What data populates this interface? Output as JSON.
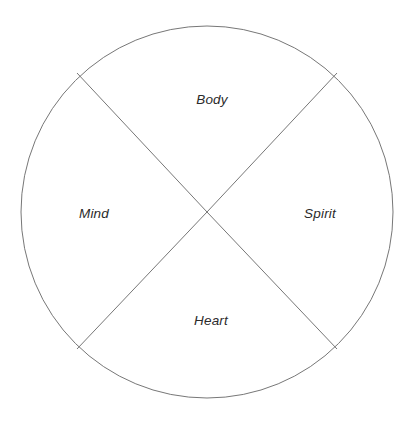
{
  "diagram": {
    "type": "quadrant-circle",
    "background_color": "#ffffff",
    "stroke_color": "#777777",
    "text_color": "#2b2b2b",
    "circle": {
      "center_x": 207,
      "center_y": 212,
      "radius": 186,
      "stroke_width": 1
    },
    "chords": [
      {
        "name": "chord-top-left-to-center",
        "x1": 77,
        "y1": 73,
        "x2": 207,
        "y2": 212
      },
      {
        "name": "chord-top-right-to-center",
        "x1": 337,
        "y1": 73,
        "x2": 207,
        "y2": 212
      },
      {
        "name": "chord-bottom-right-to-center",
        "x1": 337,
        "y1": 349,
        "x2": 207,
        "y2": 212
      },
      {
        "name": "chord-bottom-left-to-center",
        "x1": 77,
        "y1": 349,
        "x2": 207,
        "y2": 212
      }
    ],
    "quadrants": [
      {
        "id": "body",
        "label": "Body",
        "position": "top"
      },
      {
        "id": "mind",
        "label": "Mind",
        "position": "left"
      },
      {
        "id": "spirit",
        "label": "Spirit",
        "position": "right"
      },
      {
        "id": "heart",
        "label": "Heart",
        "position": "bottom"
      }
    ]
  }
}
